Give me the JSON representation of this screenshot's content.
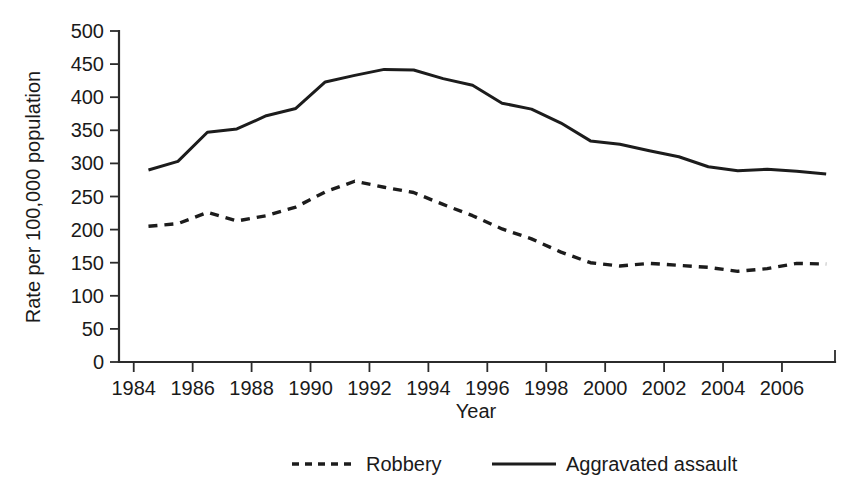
{
  "chart_data": {
    "type": "line",
    "title": "",
    "xlabel": "Year",
    "ylabel": "Rate per 100,000 population",
    "xlim": [
      1983.5,
      2007.8
    ],
    "ylim": [
      0,
      500
    ],
    "grid": false,
    "legend_position": "bottom-center",
    "x": [
      1984,
      1985,
      1986,
      1987,
      1988,
      1989,
      1990,
      1991,
      1992,
      1993,
      1994,
      1995,
      1996,
      1997,
      1998,
      1999,
      2000,
      2001,
      2002,
      2003,
      2004,
      2005,
      2006,
      2007
    ],
    "xticks": [
      1984,
      1986,
      1988,
      1990,
      1992,
      1994,
      1996,
      1998,
      2000,
      2002,
      2004,
      2006
    ],
    "xtick_labels": [
      "1984",
      "1986",
      "1988",
      "1990",
      "1992",
      "1994",
      "1996",
      "1998",
      "2000",
      "2002",
      "2004",
      "2006"
    ],
    "yticks": [
      0,
      50,
      100,
      150,
      200,
      250,
      300,
      350,
      400,
      450,
      500
    ],
    "ytick_labels": [
      "0",
      "50",
      "100",
      "150",
      "200",
      "250",
      "300",
      "350",
      "400",
      "450",
      "500"
    ],
    "series": [
      {
        "name": "Robbery",
        "style": "dashed",
        "color": "#1c1c1c",
        "values": [
          205,
          209,
          226,
          213,
          221,
          234,
          257,
          273,
          264,
          256,
          238,
          221,
          201,
          186,
          166,
          150,
          145,
          149,
          146,
          143,
          137,
          141,
          149,
          148
        ]
      },
      {
        "name": "Aggravated assault",
        "style": "solid",
        "color": "#1c1c1c",
        "values": [
          290,
          303,
          347,
          352,
          372,
          383,
          423,
          433,
          442,
          441,
          428,
          418,
          391,
          382,
          361,
          334,
          329,
          319,
          310,
          295,
          289,
          291,
          288,
          284
        ]
      }
    ],
    "legend": [
      {
        "label": "Robbery",
        "style": "dashed"
      },
      {
        "label": "Aggravated assault",
        "style": "solid"
      }
    ]
  }
}
